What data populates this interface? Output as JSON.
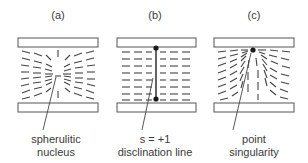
{
  "figure": {
    "panels": [
      {
        "id": "a",
        "label": "(a)",
        "caption_line1": "spherulitic",
        "caption_line2": "nucleus",
        "defect_type": "spherulitic-nucleus"
      },
      {
        "id": "b",
        "label": "(b)",
        "caption_line1": "s = +1",
        "caption_line2": "disclination line",
        "defect_type": "disclination-line"
      },
      {
        "id": "c",
        "label": "(c)",
        "caption_line1": "point",
        "caption_line2": "singularity",
        "defect_type": "point-singularity"
      }
    ],
    "colors": {
      "ink": "#444444",
      "plate_stroke": "#555555",
      "background": "#ffffff"
    }
  }
}
